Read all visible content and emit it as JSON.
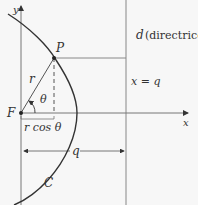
{
  "diagram": {
    "labels": {
      "y_axis": "y",
      "x_axis": "x",
      "point": "P",
      "focus": "F",
      "radius": "r",
      "angle": "θ",
      "projection": "r cos θ",
      "distance": "q",
      "curve": "C",
      "directrix_var": "d",
      "directrix_text": "(directrice)",
      "directrix_eq": "x = q"
    },
    "colors": {
      "curve": "#333333",
      "axes": "#555555",
      "guides": "#888888",
      "background": "#f7f7f7"
    }
  }
}
